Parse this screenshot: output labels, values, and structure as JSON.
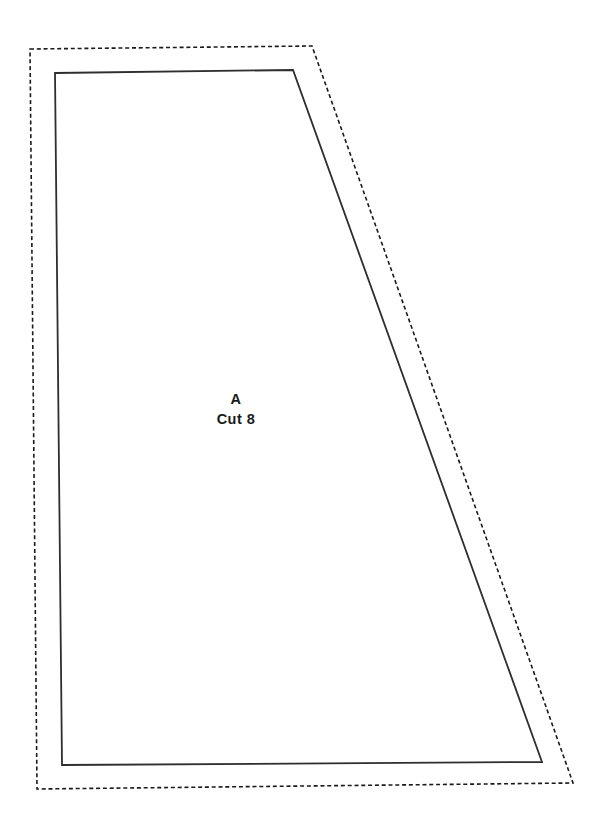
{
  "page": {
    "background": "#ffffff",
    "width": 607,
    "height": 827
  },
  "pattern_piece": {
    "label": "A",
    "cut_instruction": "Cut 8",
    "text_color": "#1a1a1a",
    "cutting_line": {
      "style": "dashed",
      "color": "#1a1a1a",
      "points": "30,49 312,46 573,783 37,789"
    },
    "stitching_line": {
      "style": "solid",
      "color": "#2e2e2e",
      "points": "55,73 293,70 542,762 62,765"
    }
  }
}
